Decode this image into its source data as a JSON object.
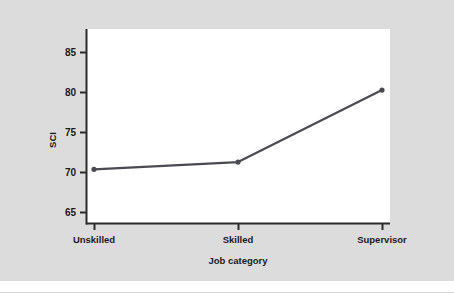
{
  "figure": {
    "background_color": "#dcdcdc",
    "plot_background_color": "#ffffff",
    "line_color": "#4a4a52",
    "axis_color": "#2b2b2b",
    "text_color": "#1a1a1a"
  },
  "chart_data": {
    "type": "line",
    "title": "",
    "subtitle": "",
    "xlabel": "Job category",
    "ylabel": "SCI",
    "categories": [
      "Unskilled",
      "Skilled",
      "Supervisor"
    ],
    "values": [
      70.4,
      71.3,
      80.3
    ],
    "series": [
      {
        "name": "SCI",
        "values": [
          70.4,
          71.3,
          80.3
        ]
      }
    ],
    "ylim": [
      65,
      86.5
    ],
    "yticks": [
      65,
      70,
      75,
      80,
      85
    ],
    "ytick_labels": [
      "65",
      "70",
      "75",
      "80",
      "85"
    ],
    "xtick_labels": [
      "Unskilled",
      "Skilled",
      "Supervisor"
    ],
    "grid": false,
    "legend": false,
    "legend_position": "none",
    "markers": true
  }
}
